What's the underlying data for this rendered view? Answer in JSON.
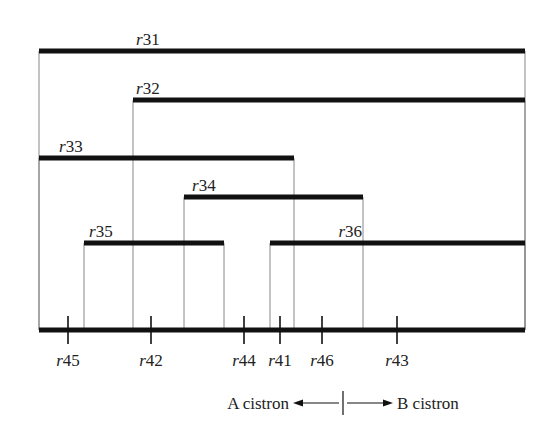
{
  "diagram": {
    "type": "deletion-map",
    "colors": {
      "line": "#111111",
      "thin_line": "#888888",
      "text": "#222222",
      "background": "#ffffff"
    },
    "deletions": [
      {
        "id": "r31",
        "label_prefix": "r",
        "label_num": "31",
        "y": 51,
        "x1": 39,
        "x2": 525,
        "label_x": 136,
        "label_anchor": "start"
      },
      {
        "id": "r32",
        "label_prefix": "r",
        "label_num": "32",
        "y": 100,
        "x1": 133,
        "x2": 525,
        "label_x": 136,
        "label_anchor": "start"
      },
      {
        "id": "r33",
        "label_prefix": "r",
        "label_num": "33",
        "y": 158,
        "x1": 39,
        "x2": 294,
        "label_x": 59,
        "label_anchor": "start"
      },
      {
        "id": "r34",
        "label_prefix": "r",
        "label_num": "34",
        "y": 197,
        "x1": 184,
        "x2": 363,
        "label_x": 192,
        "label_anchor": "start"
      },
      {
        "id": "r35",
        "label_prefix": "r",
        "label_num": "35",
        "y": 243,
        "x1": 84,
        "x2": 224,
        "label_x": 89,
        "label_anchor": "start"
      },
      {
        "id": "r36",
        "label_prefix": "r",
        "label_num": "36",
        "y": 243,
        "x1": 270,
        "x2": 525,
        "label_x": 362,
        "label_anchor": "end"
      }
    ],
    "baseline": {
      "y": 330,
      "x1": 39,
      "x2": 525
    },
    "point_mutations": [
      {
        "id": "r45",
        "label_prefix": "r",
        "label_num": "45",
        "x": 68
      },
      {
        "id": "r42",
        "label_prefix": "r",
        "label_num": "42",
        "x": 151
      },
      {
        "id": "r44",
        "label_prefix": "r",
        "label_num": "44",
        "x": 244
      },
      {
        "id": "r41",
        "label_prefix": "r",
        "label_num": "41",
        "x": 280
      },
      {
        "id": "r46",
        "label_prefix": "r",
        "label_num": "46",
        "x": 322
      },
      {
        "id": "r43",
        "label_prefix": "r",
        "label_num": "43",
        "x": 397
      }
    ],
    "cistrons": {
      "left_label": "A cistron",
      "right_label": "B cistron",
      "divider_x": 343,
      "y": 403
    }
  }
}
